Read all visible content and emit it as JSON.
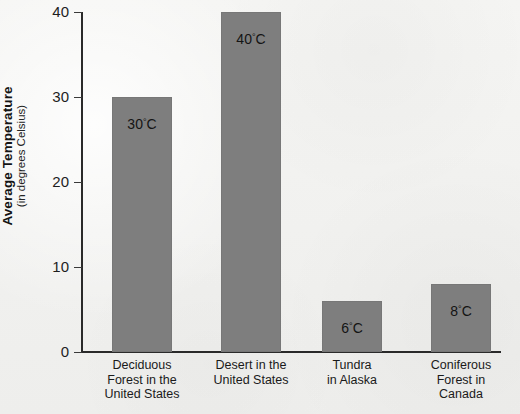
{
  "chart_data": {
    "type": "bar",
    "title": "",
    "xlabel": "",
    "ylabel": "Average Temperature",
    "ylabel_sub": "(in degrees Celsius)",
    "ylim": [
      0,
      40
    ],
    "yticks": [
      0,
      10,
      20,
      30,
      40
    ],
    "ytick_labels": [
      "0",
      "10",
      "20",
      "30",
      "40"
    ],
    "grid": false,
    "legend": "none",
    "bar_color": "#7e7e7e",
    "background_color": "#f3f3f1",
    "axis_color": "#2a2a2a",
    "unit_suffix": "C",
    "degree_symbol": "°",
    "categories": [
      "Deciduous Forest in the United States",
      "Desert in the United States",
      "Tundra in Alaska",
      "Coniferous Forest in Canada"
    ],
    "category_lines": [
      [
        "Deciduous",
        "Forest in the",
        "United States"
      ],
      [
        "Desert in the",
        "United States"
      ],
      [
        "Tundra",
        "in Alaska"
      ],
      [
        "Coniferous",
        "Forest in",
        "Canada"
      ]
    ],
    "values": [
      30,
      40,
      6,
      8
    ],
    "value_labels": [
      "30",
      "40",
      "6",
      "8"
    ],
    "value_labels_full": [
      "30°C",
      "40°C",
      "6°C",
      "8°C"
    ]
  }
}
